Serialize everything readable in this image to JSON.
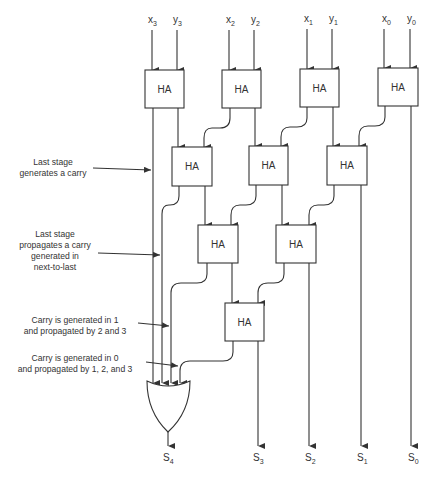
{
  "diagram": {
    "title": "",
    "inputs": [
      {
        "base": "x",
        "sub": "3"
      },
      {
        "base": "y",
        "sub": "3"
      },
      {
        "base": "x",
        "sub": "2"
      },
      {
        "base": "y",
        "sub": "2"
      },
      {
        "base": "x",
        "sub": "1"
      },
      {
        "base": "y",
        "sub": "1"
      },
      {
        "base": "x",
        "sub": "0"
      },
      {
        "base": "y",
        "sub": "0"
      }
    ],
    "outputs": [
      {
        "base": "S",
        "sub": "4"
      },
      {
        "base": "S",
        "sub": "3"
      },
      {
        "base": "S",
        "sub": "2"
      },
      {
        "base": "S",
        "sub": "1"
      },
      {
        "base": "S",
        "sub": "0"
      }
    ],
    "blocks": {
      "row1": [
        "HA",
        "HA",
        "HA",
        "HA"
      ],
      "row2": [
        "HA",
        "HA",
        "HA"
      ],
      "row3": [
        "HA",
        "HA"
      ],
      "row4": [
        "HA"
      ],
      "gate": "OR"
    },
    "annotations": [
      {
        "lines": [
          "Last stage",
          "generates a carry"
        ]
      },
      {
        "lines": [
          "Last stage",
          "propagates a carry",
          "generated in",
          "next-to-last"
        ]
      },
      {
        "lines": [
          "Carry is generated in 1",
          "and propagated by 2 and 3"
        ]
      },
      {
        "lines": [
          "Carry is generated in 0",
          "and propagated by 1, 2, and 3"
        ]
      }
    ]
  }
}
